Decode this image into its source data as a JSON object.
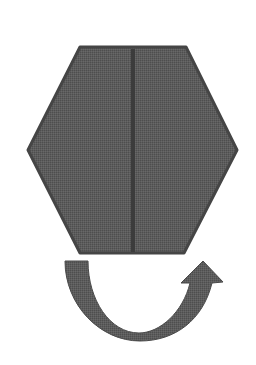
{
  "diagram": {
    "description": "Hexagon divided by a vertical line, with a curved U-turn arrow below it indicating a flip/rotation",
    "colors": {
      "background": "#ffffff",
      "shape_fill": "#5a5a5a",
      "shape_stroke": "#444444",
      "divider": "#3e3e3e",
      "arrow_fill": "#575757"
    },
    "hexagon": {
      "points": "80,47 186,47 237,150 184,253 80,253 28,150"
    },
    "divider_line": {
      "x1": 133,
      "y1": 49,
      "x2": 133,
      "y2": 252
    },
    "arrow": {
      "direction": "curved-up-right",
      "path": "M65,261 L88,261 C88,300 110,333 139,333 C160,333 183,312 190,283 L181,283 L203,261 L223,282 L212,283 C203,320 175,341 140,341 C100,341 65,305 65,261 Z"
    }
  }
}
